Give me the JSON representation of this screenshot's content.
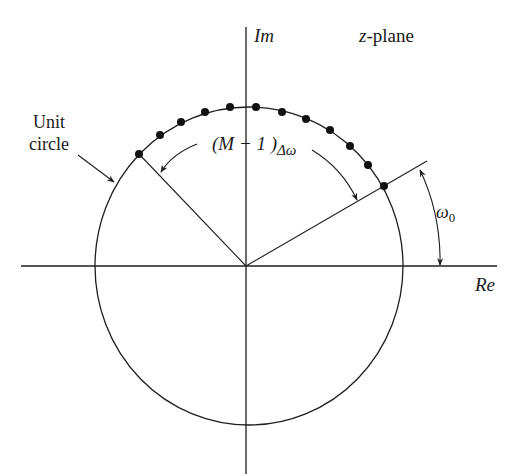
{
  "title": "z-plane",
  "axes": {
    "real_label": "Re",
    "imag_label": "Im",
    "center": [
      246,
      266
    ],
    "horizontal": {
      "x1": 21,
      "x2": 497
    },
    "vertical": {
      "y1": 27,
      "y2": 474
    }
  },
  "unit_circle": {
    "label_line1": "Unit",
    "label_line2": "circle",
    "rx": 153,
    "ry": 159
  },
  "angles": {
    "start_label_symbol": "ω",
    "start_label_sub": "0",
    "span_label_prefix": "(M − 1 )",
    "span_label_suffix": "Δω"
  },
  "sample_points": {
    "count": 12,
    "points": [
      [
        139,
        154
      ],
      [
        160,
        135
      ],
      [
        181,
        122
      ],
      [
        205,
        112
      ],
      [
        230,
        107
      ],
      [
        256,
        107
      ],
      [
        282,
        112
      ],
      [
        306,
        119
      ],
      [
        330,
        130
      ],
      [
        350,
        146
      ],
      [
        368,
        165
      ],
      [
        384,
        186
      ]
    ]
  },
  "colors": {
    "ink": "#1e1e1e",
    "background": "#ffffff"
  }
}
